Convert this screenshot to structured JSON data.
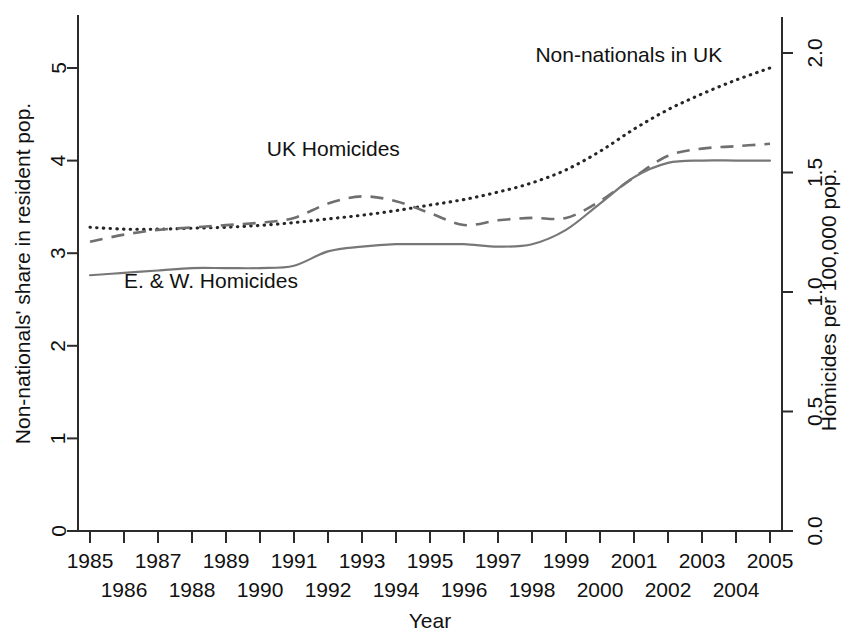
{
  "chart_data": {
    "type": "line",
    "title": "",
    "xlabel": "Year",
    "ylabel": "Non-nationals' share in resident pop.",
    "y2label": "Homicides per 100,000 pop.",
    "xlim": [
      1985,
      2005
    ],
    "ylim": [
      0,
      5.4
    ],
    "y2lim": [
      0,
      2.0
    ],
    "grid": false,
    "legend_position": "inline-annotations",
    "x": [
      1985,
      1986,
      1987,
      1988,
      1989,
      1990,
      1991,
      1992,
      1993,
      1994,
      1995,
      1996,
      1997,
      1998,
      1999,
      2000,
      2001,
      2002,
      2003,
      2004,
      2005
    ],
    "x_tick_labels_top": [
      "1985",
      "1987",
      "1989",
      "1991",
      "1993",
      "1995",
      "1997",
      "1999",
      "2001",
      "2003",
      "2005"
    ],
    "x_tick_labels_bottom": [
      "1986",
      "1988",
      "1990",
      "1992",
      "1994",
      "1996",
      "1998",
      "2000",
      "2002",
      "2004"
    ],
    "y_tick_labels": [
      "0",
      "1",
      "2",
      "3",
      "4",
      "5"
    ],
    "y_ticks": [
      0,
      1,
      2,
      3,
      4,
      5
    ],
    "y2_tick_labels": [
      "0.0",
      "0.5",
      "1.0",
      "1.5",
      "2.0"
    ],
    "y2_ticks": [
      0.0,
      0.5,
      1.0,
      1.5,
      2.0
    ],
    "series": [
      {
        "name": "Non-nationals in UK",
        "style": "dotted",
        "color": "#262626",
        "axis": "left",
        "values": [
          3.28,
          3.26,
          3.26,
          3.27,
          3.28,
          3.3,
          3.33,
          3.37,
          3.41,
          3.46,
          3.52,
          3.58,
          3.66,
          3.76,
          3.9,
          4.1,
          4.34,
          4.55,
          4.72,
          4.87,
          5.0
        ]
      },
      {
        "name": "UK Homicides",
        "style": "dashed",
        "color": "#6f6f6f",
        "axis": "right",
        "values": [
          1.21,
          1.24,
          1.26,
          1.27,
          1.28,
          1.29,
          1.31,
          1.37,
          1.4,
          1.38,
          1.33,
          1.28,
          1.3,
          1.31,
          1.31,
          1.38,
          1.48,
          1.57,
          1.6,
          1.61,
          1.62
        ]
      },
      {
        "name": "E. & W. Homicides",
        "style": "solid",
        "color": "#777777",
        "axis": "right",
        "values": [
          1.07,
          1.08,
          1.09,
          1.1,
          1.1,
          1.1,
          1.11,
          1.17,
          1.19,
          1.2,
          1.2,
          1.2,
          1.19,
          1.2,
          1.26,
          1.37,
          1.48,
          1.54,
          1.55,
          1.55,
          1.55
        ]
      }
    ],
    "annotations": [
      {
        "text": "Non-nationals in UK",
        "x": 1998.1,
        "y": 5.06
      },
      {
        "text": "UK Homicides",
        "x": 1990.2,
        "y": 4.05
      },
      {
        "text": "E. & W. Homicides",
        "x": 1986.0,
        "y": 2.62
      }
    ]
  }
}
